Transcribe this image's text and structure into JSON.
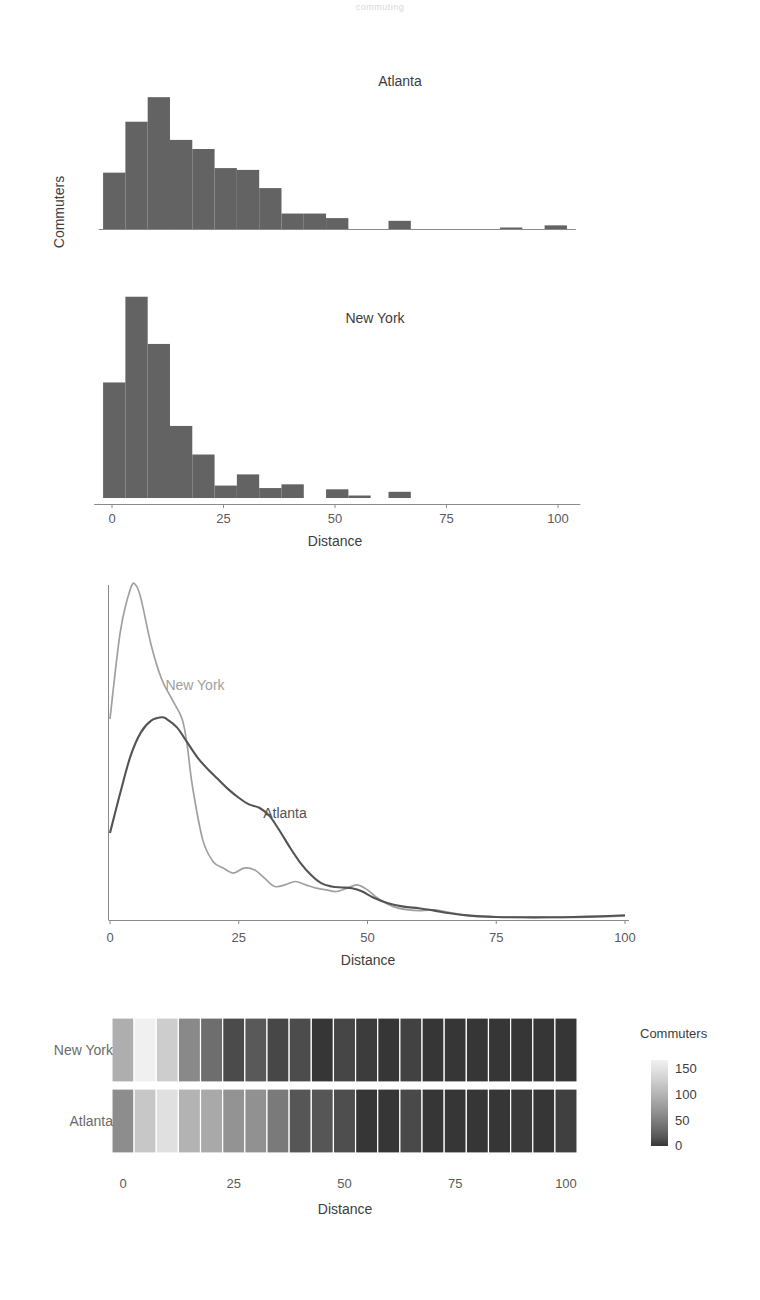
{
  "page": {
    "title_faint": "commuting",
    "background": "#ffffff"
  },
  "colors": {
    "bar": "#636363",
    "atlanta_curve": "#545454",
    "newyork_curve": "#a0a0a0",
    "axis": "#8a8a8a",
    "text": "#3d3d3d",
    "muted_text": "#6b6b6b"
  },
  "panel_histogram": {
    "name": "faceted-histogram",
    "y_axis_title": "Commuters",
    "x_axis_title": "Distance",
    "x_ticks": [
      0,
      25,
      50,
      75,
      100
    ],
    "facets": [
      {
        "label": "Atlanta"
      },
      {
        "label": "New York"
      }
    ]
  },
  "panel_density": {
    "name": "density-plot",
    "x_axis_title": "Distance",
    "x_ticks": [
      0,
      25,
      50,
      75,
      100
    ],
    "series_labels": [
      {
        "label": "New York"
      },
      {
        "label": "Atlanta"
      }
    ]
  },
  "panel_heatmap": {
    "name": "heatmap",
    "x_axis_title": "Distance",
    "x_ticks": [
      0,
      25,
      50,
      75,
      100
    ],
    "row_labels": [
      "New York",
      "Atlanta"
    ],
    "legend_title": "Commuters",
    "legend_ticks": [
      150,
      100,
      50,
      0
    ]
  },
  "chart_data": [
    {
      "type": "bar",
      "id": "histogram-atlanta",
      "title": "Atlanta",
      "xlabel": "Distance",
      "ylabel": "Commuters",
      "xlim": [
        -2,
        108
      ],
      "ylim": [
        0,
        165
      ],
      "bin_width": 5,
      "bin_starts": [
        -2,
        3,
        8,
        13,
        18,
        23,
        28,
        33,
        38,
        43,
        48,
        53,
        62,
        87,
        97
      ],
      "values": [
        62,
        118,
        145,
        98,
        88,
        67,
        65,
        45,
        17,
        17,
        12,
        0,
        9,
        1.5,
        4
      ]
    },
    {
      "type": "bar",
      "id": "histogram-newyork",
      "title": "New York",
      "xlabel": "Distance",
      "ylabel": "Commuters",
      "xlim": [
        -2,
        108
      ],
      "ylim": [
        0,
        165
      ],
      "bin_width": 5,
      "bin_starts": [
        -2,
        3,
        8,
        13,
        18,
        23,
        28,
        33,
        38,
        48,
        53,
        62
      ],
      "values": [
        93,
        162,
        124,
        58,
        35,
        10,
        19,
        8,
        11,
        7,
        2,
        5
      ]
    },
    {
      "type": "line",
      "id": "density-newyork",
      "name": "New York",
      "xlabel": "Distance",
      "xlim": [
        0,
        100
      ],
      "ylim": [
        0,
        1
      ],
      "color": "#a0a0a0",
      "x": [
        0,
        2,
        4,
        5,
        6,
        8,
        10,
        12,
        14,
        15,
        16,
        18,
        20,
        22,
        24,
        26,
        28,
        30,
        32,
        34,
        36,
        38,
        40,
        42,
        44,
        46,
        48,
        50,
        52,
        55,
        58,
        60,
        63,
        66,
        70,
        75,
        80,
        85,
        90,
        95,
        100
      ],
      "y": [
        0.6,
        0.86,
        0.99,
        1.0,
        0.96,
        0.82,
        0.72,
        0.66,
        0.6,
        0.52,
        0.4,
        0.24,
        0.175,
        0.155,
        0.14,
        0.155,
        0.15,
        0.125,
        0.1,
        0.105,
        0.115,
        0.105,
        0.095,
        0.09,
        0.085,
        0.095,
        0.105,
        0.09,
        0.065,
        0.04,
        0.03,
        0.028,
        0.03,
        0.022,
        0.012,
        0.009,
        0.008,
        0.008,
        0.008,
        0.009,
        0.012
      ]
    },
    {
      "type": "line",
      "id": "density-atlanta",
      "name": "Atlanta",
      "xlabel": "Distance",
      "xlim": [
        0,
        100
      ],
      "ylim": [
        0,
        1
      ],
      "color": "#545454",
      "x": [
        0,
        2,
        4,
        6,
        8,
        10,
        11,
        13,
        15,
        17,
        19,
        21,
        23,
        25,
        27,
        29,
        31,
        33,
        35,
        37,
        39,
        41,
        43,
        45,
        47,
        49,
        51,
        54,
        57,
        60,
        63,
        66,
        70,
        75,
        80,
        85,
        90,
        95,
        100
      ],
      "y": [
        0.26,
        0.38,
        0.49,
        0.56,
        0.595,
        0.605,
        0.6,
        0.575,
        0.53,
        0.485,
        0.45,
        0.42,
        0.39,
        0.365,
        0.345,
        0.335,
        0.31,
        0.265,
        0.215,
        0.17,
        0.135,
        0.11,
        0.1,
        0.097,
        0.095,
        0.085,
        0.068,
        0.05,
        0.04,
        0.035,
        0.028,
        0.02,
        0.013,
        0.009,
        0.008,
        0.008,
        0.009,
        0.011,
        0.014
      ]
    },
    {
      "type": "heatmap",
      "id": "heatmap-commuters",
      "xlabel": "Distance",
      "legend_title": "Commuters",
      "rows": [
        "New York",
        "Atlanta"
      ],
      "bin_width": 5,
      "bin_starts": [
        -2.5,
        2.5,
        7.5,
        12.5,
        17.5,
        22.5,
        27.5,
        32.5,
        37.5,
        42.5,
        47.5,
        52.5,
        57.5,
        62.5,
        67.5,
        72.5,
        77.5,
        82.5,
        87.5,
        92.5,
        97.5
      ],
      "zlim": [
        0,
        165
      ],
      "values": {
        "New York": [
          93,
          162,
          124,
          58,
          35,
          10,
          19,
          8,
          11,
          0,
          7,
          2,
          0,
          5,
          0,
          0,
          0,
          0,
          0,
          0,
          0
        ],
        "Atlanta": [
          62,
          118,
          145,
          98,
          88,
          67,
          65,
          45,
          17,
          17,
          12,
          0,
          0,
          9,
          0,
          0,
          0,
          0,
          1.5,
          0,
          4
        ]
      }
    }
  ]
}
